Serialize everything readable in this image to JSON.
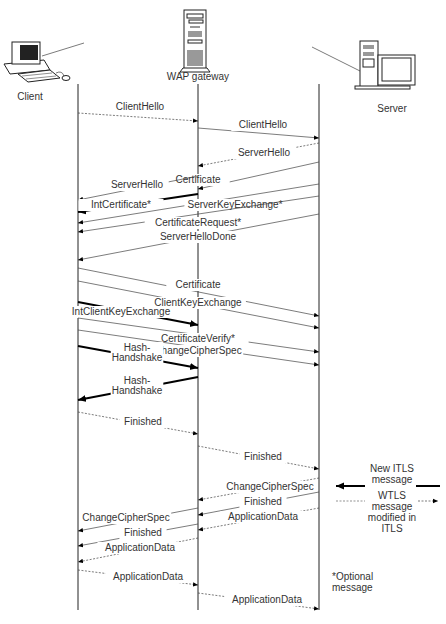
{
  "participants": [
    {
      "id": "client",
      "label": "Client",
      "x": 78,
      "label_x": 30,
      "label_y": 100
    },
    {
      "id": "gateway",
      "label": "WAP gateway",
      "x": 198,
      "label_x": 198,
      "label_y": 80
    },
    {
      "id": "server",
      "label": "Server",
      "x": 319,
      "label_x": 392,
      "label_y": 112
    }
  ],
  "lifeline_top": 84,
  "lifeline_bottom": 610,
  "messages": [
    {
      "label": "ClientHello",
      "x1": 78,
      "y1": 113,
      "x2": 198,
      "y2": 121,
      "style": "dash",
      "lx": 140,
      "ly": 110
    },
    {
      "label": "ClientHello",
      "x1": 198,
      "y1": 128,
      "x2": 319,
      "y2": 138,
      "style": "normal",
      "lx": 263,
      "ly": 128
    },
    {
      "label": "ServerHello",
      "x1": 319,
      "y1": 143,
      "x2": 198,
      "y2": 166,
      "style": "dash",
      "lx": 264,
      "ly": 156
    },
    {
      "label": "Certificate",
      "x1": 319,
      "y1": 162,
      "x2": 198,
      "y2": 189,
      "style": "normal",
      "lx": 198,
      "ly": 183
    },
    {
      "label": "ServerHello",
      "x1": 198,
      "y1": 176,
      "x2": 78,
      "y2": 200,
      "style": "normal",
      "lx": 137,
      "ly": 188
    },
    {
      "label": "IntCertificate*",
      "x1": 198,
      "y1": 194,
      "x2": 78,
      "y2": 212,
      "style": "bold",
      "lx": 121,
      "ly": 208
    },
    {
      "label": "ServerKeyExchange*",
      "x1": 319,
      "y1": 184,
      "x2": 78,
      "y2": 223,
      "style": "normal",
      "lx": 235,
      "ly": 208
    },
    {
      "label": "CertificateRequest*",
      "x1": 319,
      "y1": 196,
      "x2": 78,
      "y2": 232,
      "style": "normal",
      "lx": 198,
      "ly": 226
    },
    {
      "label": "ServerHelloDone",
      "x1": 319,
      "y1": 214,
      "x2": 78,
      "y2": 260,
      "style": "normal",
      "lx": 198,
      "ly": 240
    },
    {
      "label": "Certificate",
      "x1": 78,
      "y1": 268,
      "x2": 319,
      "y2": 316,
      "style": "normal",
      "lx": 198,
      "ly": 288
    },
    {
      "label": "ClientKeyExchange",
      "x1": 78,
      "y1": 281,
      "x2": 319,
      "y2": 328,
      "style": "normal",
      "lx": 198,
      "ly": 306
    },
    {
      "label": "IntClientKeyExchange",
      "x1": 78,
      "y1": 302,
      "x2": 198,
      "y2": 325,
      "style": "bold",
      "lx": 121,
      "ly": 315
    },
    {
      "label": "CertificateVerify*",
      "x1": 78,
      "y1": 318,
      "x2": 319,
      "y2": 352,
      "style": "normal",
      "lx": 198,
      "ly": 342
    },
    {
      "label": "ChangeCipherSpec",
      "x1": 78,
      "y1": 330,
      "x2": 319,
      "y2": 365,
      "style": "normal",
      "lx": 198,
      "ly": 354
    },
    {
      "label": "Hash-\nHandshake",
      "x1": 78,
      "y1": 346,
      "x2": 198,
      "y2": 368,
      "style": "bold",
      "lx": 137,
      "ly": 351
    },
    {
      "label": "Hash-\nHandshake",
      "x1": 198,
      "y1": 377,
      "x2": 78,
      "y2": 400,
      "style": "bold",
      "lx": 137,
      "ly": 384
    },
    {
      "label": "Finished",
      "x1": 78,
      "y1": 412,
      "x2": 198,
      "y2": 434,
      "style": "dash",
      "lx": 143,
      "ly": 425
    },
    {
      "label": "Finished",
      "x1": 198,
      "y1": 446,
      "x2": 319,
      "y2": 469,
      "style": "dash",
      "lx": 263,
      "ly": 460
    },
    {
      "label": "ChangeCipherSpec",
      "x1": 319,
      "y1": 478,
      "x2": 198,
      "y2": 500,
      "style": "dash",
      "lx": 270,
      "ly": 490
    },
    {
      "label": "Finished",
      "x1": 319,
      "y1": 492,
      "x2": 198,
      "y2": 515,
      "style": "normal",
      "lx": 263,
      "ly": 505
    },
    {
      "label": "ApplicationData",
      "x1": 319,
      "y1": 508,
      "x2": 198,
      "y2": 530,
      "style": "dash",
      "lx": 263,
      "ly": 520
    },
    {
      "label": "ChangeCipherSpec",
      "x1": 198,
      "y1": 508,
      "x2": 78,
      "y2": 531,
      "style": "normal",
      "lx": 126,
      "ly": 521
    },
    {
      "label": "Finished",
      "x1": 198,
      "y1": 524,
      "x2": 78,
      "y2": 546,
      "style": "normal",
      "lx": 143,
      "ly": 536
    },
    {
      "label": "ApplicationData",
      "x1": 198,
      "y1": 538,
      "x2": 78,
      "y2": 562,
      "style": "dash",
      "lx": 140,
      "ly": 551
    },
    {
      "label": "ApplicationData",
      "x1": 78,
      "y1": 570,
      "x2": 198,
      "y2": 585,
      "style": "dash",
      "lx": 148,
      "ly": 580
    },
    {
      "label": "ApplicationData",
      "x1": 198,
      "y1": 593,
      "x2": 319,
      "y2": 609,
      "style": "dash",
      "lx": 267,
      "ly": 603
    }
  ],
  "legend": {
    "new_itls_label": "New ITLS\nmessage",
    "wtls_modified_label": "WTLS\nmessage\nmodified in\nITLS",
    "optional_note": "*Optional\nmessage"
  }
}
